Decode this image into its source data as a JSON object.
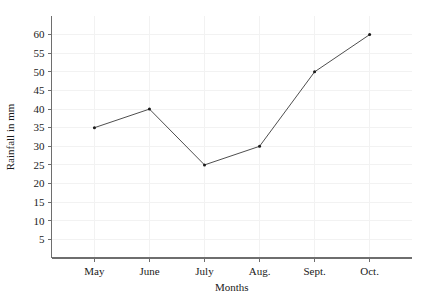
{
  "chart_data": {
    "type": "line",
    "title": "",
    "xlabel": "Months",
    "ylabel": "Rainfall in mm",
    "categories": [
      "May",
      "June",
      "July",
      "Aug.",
      "Sept.",
      "Oct."
    ],
    "values": [
      35,
      40,
      25,
      30,
      50,
      60
    ],
    "series": [
      {
        "name": "Rainfall in mm",
        "values": [
          35,
          40,
          25,
          30,
          50,
          60
        ]
      }
    ],
    "ylim": [
      0,
      65
    ],
    "yticks": [
      5,
      10,
      15,
      20,
      25,
      30,
      35,
      40,
      45,
      50,
      55,
      60
    ],
    "ytick_labels": [
      "5",
      "10",
      "15",
      "20",
      "25",
      "30",
      "35",
      "40",
      "45",
      "50",
      "55",
      "60"
    ],
    "grid": true,
    "legend": "none",
    "markers": true,
    "colors": {
      "line": "#3a3a3a",
      "marker": "#1a1a1a",
      "grid": "#f2f2f2",
      "axis": "#6e6e6e",
      "background": "#ffffff",
      "text": "#1a1a1a"
    }
  }
}
